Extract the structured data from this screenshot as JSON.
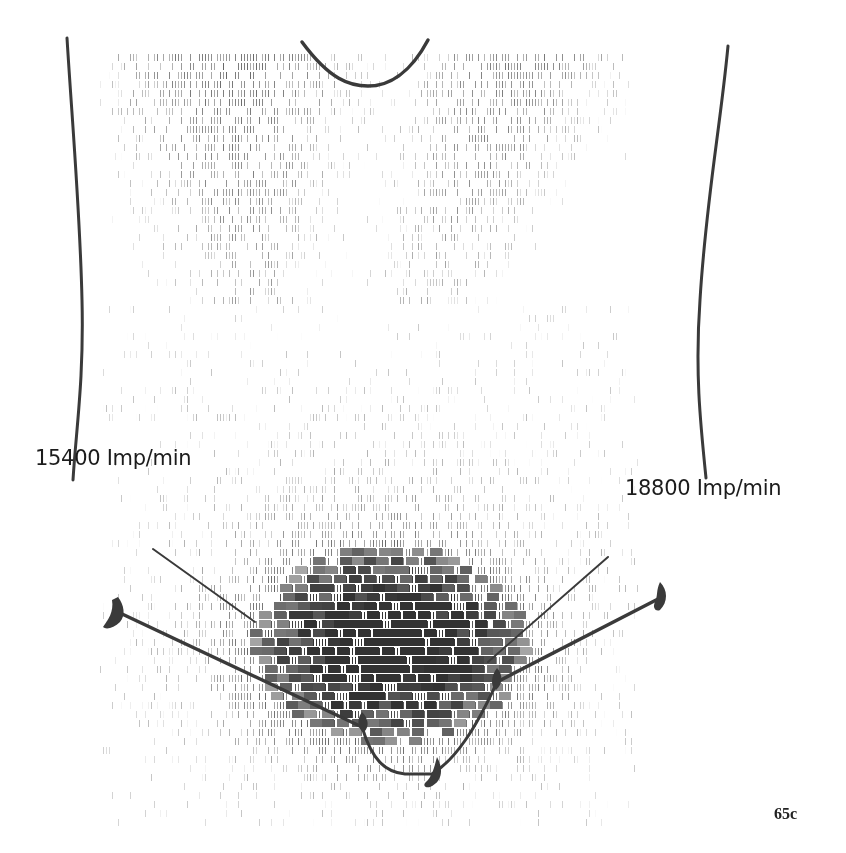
{
  "figure": {
    "number": "65c",
    "type": "scintigram",
    "labels": {
      "left_count": "15400 Imp/min",
      "right_count": "18800 Imp/min"
    },
    "colors": {
      "ink": "#3a3a3a",
      "background": "#ffffff",
      "text": "#1c1c1c"
    },
    "regions": [
      {
        "name": "upper-diffuse-activity",
        "density": "low"
      },
      {
        "name": "lower-dense-activity",
        "density": "high"
      }
    ],
    "annotations": [
      {
        "name": "left-body-contour"
      },
      {
        "name": "right-body-contour"
      },
      {
        "name": "neck-notch-contour"
      },
      {
        "name": "left-marker-line"
      },
      {
        "name": "right-marker-line"
      },
      {
        "name": "left-arrow-marker"
      },
      {
        "name": "right-arrow-marker"
      },
      {
        "name": "bottom-arrow-marker"
      }
    ]
  }
}
